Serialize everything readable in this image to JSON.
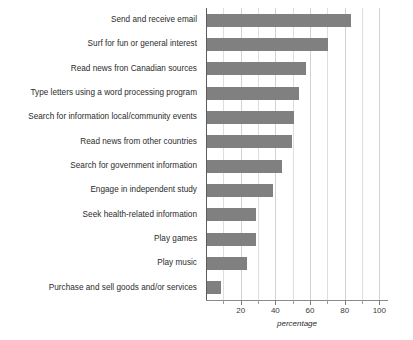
{
  "chart_data": {
    "type": "bar",
    "orientation": "horizontal",
    "title": "",
    "xlabel": "percentage",
    "ylabel": "",
    "xlim": [
      0,
      105
    ],
    "xticks": [
      20,
      40,
      60,
      80,
      100
    ],
    "minor_xticks": [
      10,
      30,
      50,
      70,
      90
    ],
    "grid": true,
    "legend": false,
    "bar_color": "#808080",
    "categories": [
      "Send and receive email",
      "Surf for fun or general interest",
      "Read news fron Canadian sources",
      "Type letters using a word processing program",
      "Search for information local/community events",
      "Read news from other countries",
      "Search for government information",
      "Engage in independent study",
      "Seek health-related information",
      "Play games",
      "Play music",
      "Purchase and sell goods and/or services"
    ],
    "values": [
      83,
      70,
      57,
      53,
      50,
      49,
      43,
      38,
      28,
      28,
      23,
      8
    ]
  },
  "axis": {
    "tick_labels": [
      "20",
      "40",
      "60",
      "80",
      "100"
    ],
    "x_axis_title": "percentage"
  }
}
